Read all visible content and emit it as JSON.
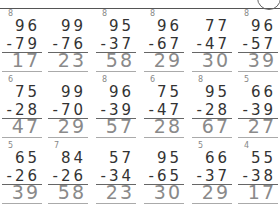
{
  "worksheet": {
    "rows": [
      {
        "problems": [
          {
            "carry": "8",
            "top": "96",
            "subtrahend": "-79",
            "answer": "17"
          },
          {
            "carry": "",
            "top": "99",
            "subtrahend": "-76",
            "answer": "23"
          },
          {
            "carry": "8",
            "top": "95",
            "subtrahend": "-37",
            "answer": "58"
          },
          {
            "carry": "8",
            "top": "96",
            "subtrahend": "-67",
            "answer": "29"
          },
          {
            "carry": "",
            "top": "77",
            "subtrahend": "-47",
            "answer": "30"
          },
          {
            "carry": "8",
            "top": "96",
            "subtrahend": "-57",
            "answer": "39"
          }
        ]
      },
      {
        "problems": [
          {
            "carry": "6",
            "top": "75",
            "subtrahend": "-28",
            "answer": "47"
          },
          {
            "carry": "",
            "top": "99",
            "subtrahend": "-70",
            "answer": "29"
          },
          {
            "carry": "8",
            "top": "96",
            "subtrahend": "-39",
            "answer": "57"
          },
          {
            "carry": "6",
            "top": "75",
            "subtrahend": "-47",
            "answer": "28"
          },
          {
            "carry": "8",
            "top": "95",
            "subtrahend": "-28",
            "answer": "67"
          },
          {
            "carry": "5",
            "top": "66",
            "subtrahend": "-39",
            "answer": "27"
          }
        ]
      },
      {
        "problems": [
          {
            "carry": "5",
            "top": "65",
            "subtrahend": "-26",
            "answer": "39"
          },
          {
            "carry": "7",
            "top": "84",
            "subtrahend": "-26",
            "answer": "58"
          },
          {
            "carry": "",
            "top": "57",
            "subtrahend": "-34",
            "answer": "23"
          },
          {
            "carry": "",
            "top": "95",
            "subtrahend": "-65",
            "answer": "30"
          },
          {
            "carry": "5",
            "top": "66",
            "subtrahend": "-37",
            "answer": "29"
          },
          {
            "carry": "4",
            "top": "55",
            "subtrahend": "-38",
            "answer": "17"
          }
        ]
      }
    ]
  }
}
